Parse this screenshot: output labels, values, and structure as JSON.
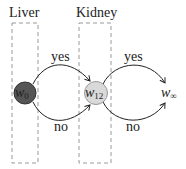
{
  "diagram": {
    "groups": [
      {
        "id": "liver",
        "label": "Liver"
      },
      {
        "id": "kidney",
        "label": "Kidney"
      }
    ],
    "nodes": [
      {
        "id": "w0",
        "base": "w",
        "sub": "0",
        "fill": "#555555"
      },
      {
        "id": "w12",
        "base": "w",
        "sub": "12",
        "fill": "#d9d9d9"
      },
      {
        "id": "winf",
        "base": "w",
        "sub": "∞",
        "fill": "none"
      }
    ],
    "edges": [
      {
        "from": "w0",
        "to": "w12",
        "label": "yes"
      },
      {
        "from": "w0",
        "to": "w12",
        "label": "no"
      },
      {
        "from": "w12",
        "to": "winf",
        "label": "yes"
      },
      {
        "from": "w12",
        "to": "winf",
        "label": "no"
      }
    ]
  }
}
